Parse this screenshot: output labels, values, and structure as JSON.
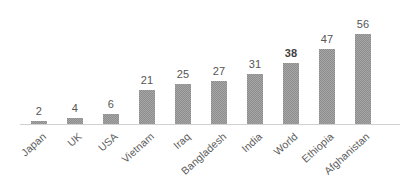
{
  "chart_data": {
    "type": "bar",
    "title": "",
    "subtitle": "",
    "xlabel": "",
    "ylabel": "",
    "grid": false,
    "legend": false,
    "axis": {
      "y_axis_visible": false,
      "x_axis_visible": true,
      "ylim": [
        0,
        60
      ]
    },
    "orientation": "vertical",
    "categories": [
      "Japan",
      "UK",
      "USA",
      "Vietnam",
      "Iraq",
      "Bangladesh",
      "India",
      "World",
      "Ethiopia",
      "Afghanistan"
    ],
    "values": [
      2,
      4,
      6,
      21,
      25,
      27,
      31,
      38,
      47,
      56
    ],
    "value_labels": [
      "2",
      "4",
      "6",
      "21",
      "25",
      "27",
      "31",
      "38",
      "47",
      "56"
    ],
    "emphasized_categories": [
      "World"
    ],
    "colors": {
      "bar_fill": "#8d8d8d",
      "value_label": "#555555",
      "value_label_emphasis": "#3f3f3f",
      "category_label": "#5c5c5c",
      "axis_line": "#d0d0d0",
      "background": "#ffffff"
    }
  }
}
